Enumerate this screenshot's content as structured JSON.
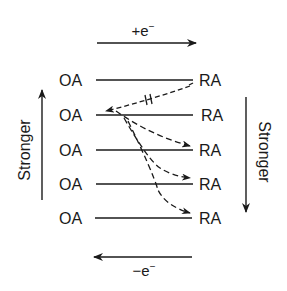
{
  "diagram": {
    "top_arrow": {
      "label": "+e",
      "superscript": "−",
      "direction": "right"
    },
    "bottom_arrow": {
      "label": "−e",
      "superscript": "−",
      "direction": "left"
    },
    "left_axis": {
      "label": "Stronger",
      "direction": "up"
    },
    "right_axis": {
      "label": "Stronger",
      "direction": "down"
    },
    "rows": [
      {
        "left": "OA",
        "right": "RA"
      },
      {
        "left": "OA",
        "right": "RA"
      },
      {
        "left": "OA",
        "right": "RA"
      },
      {
        "left": "OA",
        "right": "RA"
      },
      {
        "left": "OA",
        "right": "RA"
      }
    ],
    "transfers": [
      {
        "from": "OA row 2",
        "to": "RA row 1",
        "style": "dashed",
        "blocked": true
      },
      {
        "from": "OA row 2",
        "to": "RA row 3",
        "style": "dashed",
        "blocked": false
      },
      {
        "from": "OA row 2",
        "to": "RA row 4",
        "style": "dashed",
        "blocked": false
      },
      {
        "from": "OA row 2",
        "to": "RA row 5",
        "style": "dashed",
        "blocked": false
      }
    ],
    "colors": {
      "ink": "#1a1a1a",
      "background": "#ffffff"
    }
  }
}
